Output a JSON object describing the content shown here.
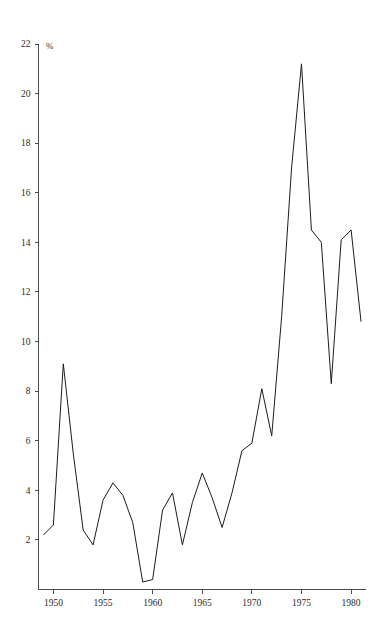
{
  "chart_data": {
    "type": "line",
    "title": "",
    "subtitle": "",
    "xlabel": "",
    "ylabel": "%",
    "unit_label": "%",
    "xlim": [
      1948.5,
      1981.5
    ],
    "ylim": [
      0,
      22
    ],
    "grid": false,
    "legend": null,
    "legend_position": "none",
    "x_ticks": [
      1950,
      1955,
      1960,
      1965,
      1970,
      1975,
      1980
    ],
    "x_tick_labels": [
      "1950",
      "1955",
      "1960",
      "1965",
      "1970",
      "1975",
      "1980"
    ],
    "y_ticks": [
      2,
      4,
      6,
      8,
      10,
      12,
      14,
      16,
      18,
      20,
      22
    ],
    "y_tick_labels": [
      "2",
      "4",
      "6",
      "8",
      "10",
      "12",
      "14",
      "16",
      "18",
      "20",
      "22"
    ],
    "line_color": "#1c1c1c",
    "axis_color": "#4d4d4d",
    "background_color": "#ffffff",
    "series": [
      {
        "name": "",
        "x": [
          1949,
          1950,
          1951,
          1952,
          1953,
          1954,
          1955,
          1956,
          1957,
          1958,
          1959,
          1960,
          1961,
          1962,
          1963,
          1964,
          1965,
          1966,
          1967,
          1968,
          1969,
          1970,
          1971,
          1972,
          1973,
          1974,
          1975,
          1976,
          1977,
          1978,
          1979,
          1980,
          1981
        ],
        "values": [
          2.2,
          2.6,
          9.1,
          5.5,
          2.4,
          1.8,
          3.6,
          4.3,
          3.8,
          2.7,
          0.3,
          0.4,
          3.2,
          3.9,
          1.8,
          3.5,
          4.7,
          3.7,
          2.5,
          3.9,
          5.6,
          5.9,
          8.1,
          6.2,
          11.0,
          17.0,
          21.2,
          14.5,
          14.0,
          8.3,
          14.1,
          14.5,
          10.8
        ]
      }
    ]
  },
  "axes": {
    "y_unit_note": "%"
  }
}
